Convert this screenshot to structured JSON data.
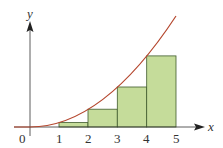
{
  "diagram": {
    "type": "riemann-sum",
    "axis_labels": {
      "x": "x",
      "y": "y"
    },
    "origin_label": "0",
    "x_ticks": [
      "1",
      "2",
      "3",
      "4",
      "5"
    ],
    "curve": {
      "function": "y = x^2",
      "color": "#b5472e"
    },
    "rectangles": [
      {
        "x_from": 1,
        "x_to": 2,
        "height": 1
      },
      {
        "x_from": 2,
        "x_to": 3,
        "height": 4
      },
      {
        "x_from": 3,
        "x_to": 4,
        "height": 9
      },
      {
        "x_from": 4,
        "x_to": 5,
        "height": 16
      }
    ],
    "colors": {
      "rect_fill": "#c5dc9a",
      "rect_stroke": "#3f5a2c",
      "axis": "#333333"
    }
  }
}
